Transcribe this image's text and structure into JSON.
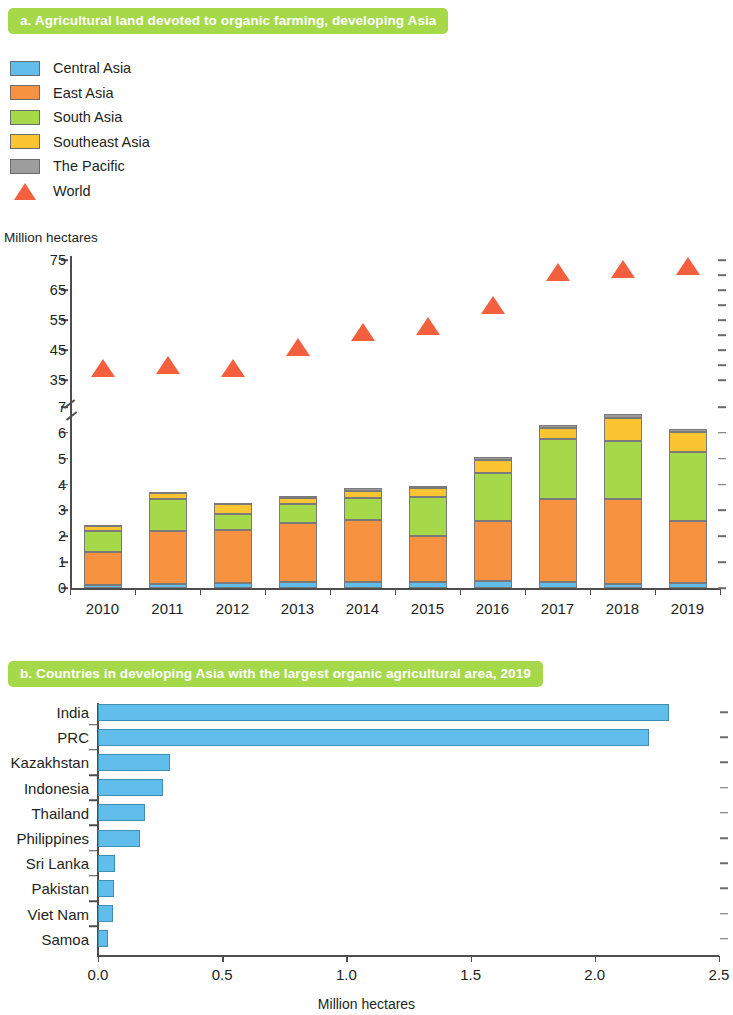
{
  "panel_a": {
    "title": "a. Agricultural land devoted to organic farming, developing Asia",
    "axis_unit": "Million hectares",
    "legend": [
      {
        "label": "Central Asia",
        "color": "#61bdeb",
        "marker": "square"
      },
      {
        "label": "East Asia",
        "color": "#f69240",
        "marker": "square"
      },
      {
        "label": "South Asia",
        "color": "#a5d94a",
        "marker": "square"
      },
      {
        "label": "Southeast Asia",
        "color": "#fbc531",
        "marker": "square"
      },
      {
        "label": "The Pacific",
        "color": "#9d9d9d",
        "marker": "square"
      },
      {
        "label": "World",
        "color": "#f4603e",
        "marker": "triangle"
      }
    ]
  },
  "panel_b": {
    "title": "b. Countries in developing Asia with the largest organic agricultural area, 2019",
    "xlabel": "Million hectares"
  },
  "chart_data": [
    {
      "type": "bar",
      "id": "panel-a-stacked-bar",
      "title": "a. Agricultural land devoted to organic farming, developing Asia",
      "xlabel": "",
      "ylabel": "Million hectares",
      "stacked": true,
      "grid": false,
      "legend_position": "top-left",
      "categories": [
        "2010",
        "2011",
        "2012",
        "2013",
        "2014",
        "2015",
        "2016",
        "2017",
        "2018",
        "2019"
      ],
      "y_axis": {
        "broken": true,
        "lower_ticks": [
          0,
          1,
          2,
          3,
          4,
          5,
          6,
          7
        ],
        "upper_ticks": [
          35,
          45,
          55,
          65,
          75
        ],
        "lower_range": [
          0,
          7
        ],
        "upper_range": [
          35,
          75
        ],
        "tick_labels": [
          "0",
          "1",
          "2",
          "3",
          "4",
          "5",
          "6",
          "7",
          "35",
          "45",
          "55",
          "65",
          "75"
        ]
      },
      "series": [
        {
          "name": "Central Asia",
          "color": "#61bdeb",
          "values": [
            0.1,
            0.14,
            0.18,
            0.23,
            0.22,
            0.22,
            0.26,
            0.22,
            0.14,
            0.2
          ]
        },
        {
          "name": "East Asia",
          "color": "#f69240",
          "values": [
            1.3,
            2.05,
            2.05,
            2.3,
            2.4,
            1.8,
            2.35,
            3.23,
            3.3,
            2.4
          ]
        },
        {
          "name": "South Asia",
          "color": "#a5d94a",
          "values": [
            0.8,
            1.25,
            0.65,
            0.7,
            0.85,
            1.5,
            1.85,
            2.3,
            2.25,
            2.65
          ]
        },
        {
          "name": "Southeast Asia",
          "color": "#fbc531",
          "values": [
            0.22,
            0.24,
            0.35,
            0.25,
            0.3,
            0.33,
            0.5,
            0.45,
            0.9,
            0.8
          ]
        },
        {
          "name": "The Pacific",
          "color": "#9d9d9d",
          "values": [
            0.03,
            0.05,
            0.07,
            0.08,
            0.1,
            0.1,
            0.12,
            0.1,
            0.15,
            0.1
          ]
        }
      ],
      "totals": [
        2.45,
        3.73,
        3.3,
        3.56,
        3.87,
        3.95,
        5.08,
        6.3,
        6.74,
        6.15
      ],
      "overlay_series": {
        "name": "World",
        "color": "#f4603e",
        "marker": "triangle",
        "axis": "upper",
        "values": [
          36,
          37,
          36,
          43,
          48,
          50,
          57,
          68,
          69,
          70
        ]
      }
    },
    {
      "type": "bar",
      "id": "panel-b-horizontal-bar",
      "orientation": "horizontal",
      "title": "b. Countries in developing Asia with the largest organic agricultural area, 2019",
      "xlabel": "Million hectares",
      "ylabel": "",
      "grid": false,
      "bar_color": "#61bdeb",
      "xlim": [
        0.0,
        2.5
      ],
      "xticks": [
        0.0,
        0.5,
        1.0,
        1.5,
        2.0,
        2.5
      ],
      "xtick_labels": [
        "0.0",
        "0.5",
        "1.0",
        "1.5",
        "2.0",
        "2.5"
      ],
      "categories": [
        "India",
        "PRC",
        "Kazakhstan",
        "Indonesia",
        "Thailand",
        "Philippines",
        "Sri Lanka",
        "Pakistan",
        "Viet Nam",
        "Samoa"
      ],
      "values": [
        2.3,
        2.22,
        0.29,
        0.26,
        0.19,
        0.17,
        0.07,
        0.065,
        0.06,
        0.04
      ]
    }
  ]
}
